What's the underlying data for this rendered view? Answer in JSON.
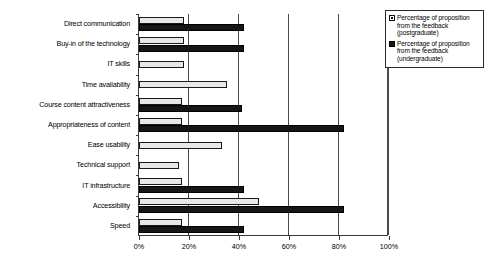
{
  "chart_data": {
    "type": "bar",
    "orientation": "horizontal",
    "title": "",
    "subtitle": "",
    "xlabel": "",
    "ylabel": "",
    "xlim": [
      0,
      100
    ],
    "xtick_labels": [
      "0%",
      "20%",
      "40%",
      "60%",
      "80%",
      "100%"
    ],
    "xtick_values": [
      0,
      20,
      40,
      60,
      80,
      100
    ],
    "grid": true,
    "grid_axis": "x",
    "legend_position": "top-right",
    "categories": [
      "Direct communication",
      "Buy-in of the technology",
      "IT skills",
      "Time availability",
      "Course content attractiveness",
      "Appropriateness of content",
      "Ease usability",
      "Technical support",
      "IT infrastructure",
      "Accessibility",
      "Speed"
    ],
    "series": [
      {
        "name": "Percentage of proposition from the feedback (postgraduate)",
        "short_name": "postgraduate",
        "color": "#e8e8e8",
        "values": [
          18,
          18,
          18,
          35,
          17,
          17,
          33,
          16,
          17,
          48,
          17
        ]
      },
      {
        "name": "Percentage of proposition from the feedback (undergraduate)",
        "short_name": "undergraduate",
        "color": "#161616",
        "values": [
          42,
          42,
          0,
          0,
          41,
          82,
          0,
          0,
          42,
          82,
          42
        ]
      }
    ]
  },
  "legend": {
    "items": [
      {
        "swatch": "light",
        "label": "Percentage of proposition from the feedback (postgraduate)"
      },
      {
        "swatch": "dark",
        "label": "Percentage of proposition from the feedback (undergraduate)"
      }
    ]
  }
}
